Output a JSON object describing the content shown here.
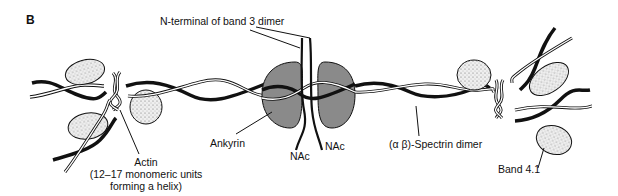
{
  "figure": {
    "panel_letter": "B",
    "labels": {
      "band3_n_terminal": "N-terminal of band 3 dimer",
      "ankyrin": "Ankyrin",
      "nac_left": "NAc",
      "nac_right": "NAc",
      "spectrin": "(α β)-Spectrin dimer",
      "band41": "Band 4.1",
      "actin_line1": "Actin",
      "actin_line2": "(12–17 monomeric units",
      "actin_line3": "forming a helix)"
    },
    "colors": {
      "ink": "#111111",
      "ankyrin_fill": "#8a8a8a",
      "band41_fill": "#e8e8e8",
      "background": "#ffffff"
    }
  }
}
